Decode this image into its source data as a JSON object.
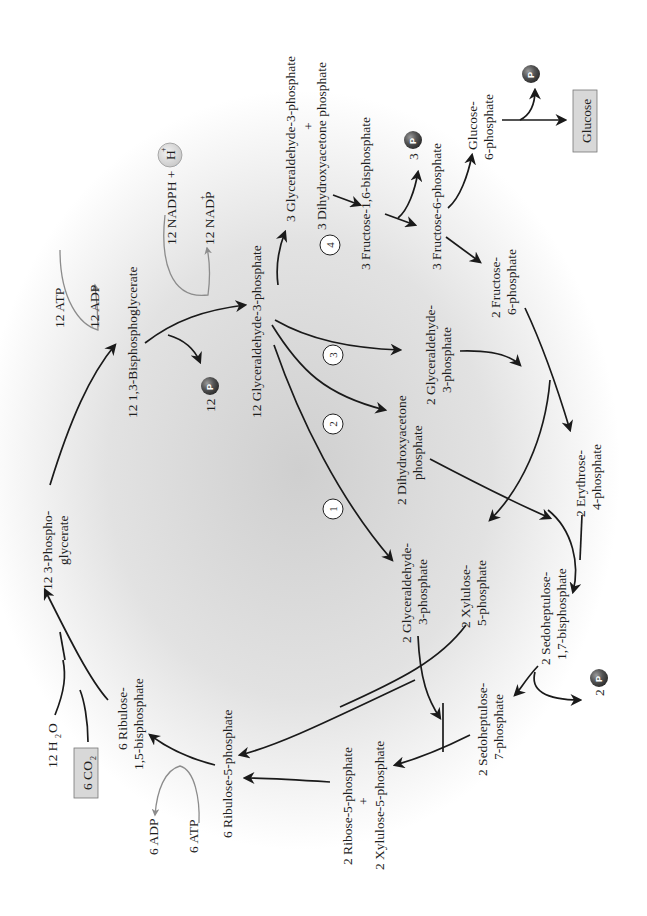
{
  "diagram": {
    "colors": {
      "arrow_main": "#1a1a1a",
      "arrow_cofactor": "#8c8c8c",
      "background_glow": "#d6d6d6",
      "boxed_fill": "#d8d8d8",
      "phosphate_ball": "#4a4a4a"
    },
    "labels": {
      "pga": [
        "12 3-Phospho-",
        "glycerate"
      ],
      "bpg": "12 1,3-Bisphosphoglycerate",
      "atp12": "12 ATP",
      "adp12": "12 ADP",
      "nadph": "12 NADPH + 12",
      "hplus": "H",
      "hplus_sup": "+",
      "nadp": "12 NADP",
      "nadp_sup": "+",
      "pi12": "12",
      "g3p12": "12 Glyceraldehyde-3-phosphate",
      "g3p_dhap3_top": "3 Glyceraldehyde-3-phosphate",
      "plus": "+",
      "g3p_dhap3_bottom": "3 Dihydroxyacetone phosphate",
      "fbp3": "3 Fructose-1,6-bisphosphate",
      "pi3": "3",
      "f6p3": "3 Fructose-6-phosphate",
      "g6p": [
        "Glucose-",
        "6-phosphate"
      ],
      "glucose": "Glucose",
      "f6p2": [
        "2 Fructose-",
        "6-phosphate"
      ],
      "g3p2_b": [
        "2 Glyceraldehyde-",
        "3-phosphate"
      ],
      "dhap2": [
        "2 Dihydroxyacetone",
        "phosphate"
      ],
      "e4p2": [
        "2 Erythrose-",
        "4-phosphate"
      ],
      "g3p2_a": [
        "2 Glyceraldehyde-",
        "3-phosphate"
      ],
      "xu5p2": [
        "2 Xylulose-",
        "5-phosphate"
      ],
      "sbp2": [
        "2 Sedoheptulose-",
        "1,7-bisphosphate"
      ],
      "pi2": "2",
      "s7p2": [
        "2 Sedoheptulose-",
        "7-phosphate"
      ],
      "r5p_top": "2 Ribose-5-phosphate",
      "r5p_plus": "+",
      "r5p_bottom": "2 Xylulose-5-phosphate",
      "ru5p6": "6 Ribulose-5-phosphate",
      "atp6": "6 ATP",
      "adp6": "6 ADP",
      "rubp6": [
        "6 Ribulose-",
        "1,5-bisphosphate"
      ],
      "h2o": "12 H",
      "h2o_sub": "2",
      "h2o_o": "O",
      "co2": "6 CO",
      "co2_sub": "2",
      "phosphate_glyph": "P"
    },
    "step_numbers": [
      "1",
      "2",
      "3",
      "4"
    ]
  }
}
